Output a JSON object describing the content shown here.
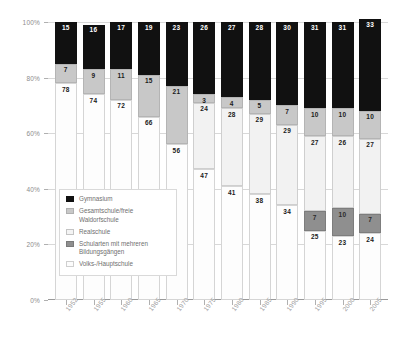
{
  "chart_data": {
    "type": "bar",
    "title": "",
    "xlabel": "",
    "ylabel": "",
    "ylim": [
      0,
      100
    ],
    "grid": true,
    "legend_position": "inside-left",
    "stacked": true,
    "stack_order": "top-to-bottom",
    "categories": [
      "1952",
      "1955",
      "1960",
      "1965",
      "1970",
      "1975",
      "1980",
      "1985",
      "1990",
      "1995",
      "2000",
      "2005"
    ],
    "ytick_labels": [
      "0%",
      "20%",
      "40%",
      "60%",
      "80%",
      "100%"
    ],
    "ytick_values": [
      0,
      20,
      40,
      60,
      80,
      100
    ],
    "series": [
      {
        "name": "Gymnasium",
        "color": "#111111",
        "values": [
          15,
          16,
          17,
          19,
          23,
          26,
          27,
          28,
          30,
          31,
          31,
          33
        ]
      },
      {
        "name": "Gesamtschule/freie Waldorfschule",
        "color": "#c8c8c8",
        "values": [
          7,
          9,
          11,
          15,
          21,
          3,
          4,
          5,
          7,
          10,
          10,
          10
        ]
      },
      {
        "name": "Realschule",
        "color": "#f2f2f2",
        "values": [
          0,
          0,
          0,
          0,
          0,
          24,
          28,
          29,
          29,
          27,
          26,
          27
        ]
      },
      {
        "name": "Schularten mit mehreren Bildungsgängen",
        "color": "#8f8f8f",
        "values": [
          0,
          0,
          0,
          0,
          0,
          0,
          0,
          0,
          0,
          7,
          10,
          7
        ]
      },
      {
        "name": "Volks-/Hauptschule",
        "color": "#fdfdfd",
        "values": [
          78,
          74,
          72,
          66,
          56,
          47,
          41,
          38,
          34,
          25,
          23,
          24
        ]
      }
    ]
  },
  "legend": {
    "items": [
      {
        "label": "Gymnasium",
        "swatch": "gym"
      },
      {
        "label": "Gesamtschule/freie Waldorfschule",
        "swatch": "ges"
      },
      {
        "label": "Realschule",
        "swatch": "real"
      },
      {
        "label": "Schularten mit mehreren Bildungsgängen",
        "swatch": "mehr"
      },
      {
        "label": "Volks-/Hauptschule",
        "swatch": "volks"
      }
    ]
  }
}
